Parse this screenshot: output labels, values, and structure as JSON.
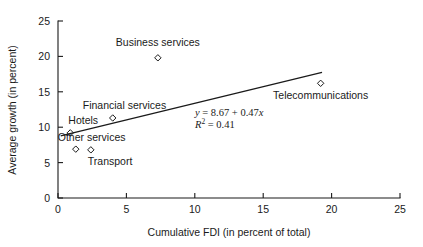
{
  "chart_data": {
    "type": "scatter",
    "title": "",
    "xlabel": "Cumulative FDI (in percent of total)",
    "ylabel": "Average growth (in percent)",
    "xlim": [
      0,
      25
    ],
    "ylim": [
      0,
      25
    ],
    "xticks": [
      "0",
      "5",
      "10",
      "15",
      "20",
      "25"
    ],
    "yticks": [
      "0",
      "5",
      "10",
      "15",
      "20",
      "25"
    ],
    "xtick_values": [
      0,
      5,
      10,
      15,
      20,
      25
    ],
    "ytick_values": [
      0,
      5,
      10,
      15,
      20,
      25
    ],
    "grid": false,
    "legend": "none",
    "marker_style": "open-diamond",
    "points": [
      {
        "label": "Hotels",
        "x": 0.9,
        "y": 9.2,
        "label_dx": -2,
        "label_dy": -9,
        "anchor": "start"
      },
      {
        "label": "Other services",
        "x": 1.3,
        "y": 6.9,
        "label_dx": -18,
        "label_dy": -8,
        "anchor": "start"
      },
      {
        "label": "Transport",
        "x": 2.4,
        "y": 6.8,
        "label_dx": -3,
        "label_dy": 15,
        "anchor": "start"
      },
      {
        "label": "Financial services",
        "x": 4.0,
        "y": 11.3,
        "label_dx": -30,
        "label_dy": -9,
        "anchor": "start"
      },
      {
        "label": "Business services",
        "x": 7.3,
        "y": 19.8,
        "label_dx": 0,
        "label_dy": -12,
        "anchor": "middle"
      },
      {
        "label": "Telecommunications",
        "x": 19.2,
        "y": 16.2,
        "label_dx": 0,
        "label_dy": 16,
        "anchor": "middle"
      }
    ],
    "regression": {
      "intercept": 8.67,
      "slope": 0.47,
      "r_squared": 0.41,
      "x_start": 0.2,
      "x_end": 19.3,
      "equation_text": "y = 8.67 + 0.47x",
      "r_squared_text": "R2 = 0.41",
      "eq_parts": {
        "y": "y",
        "eq1": " = 8.67 + 0.47",
        "x": "x",
        "r": "R",
        "sup": "2",
        "eq2": " = 0.41"
      }
    },
    "colors": {
      "axis": "#1a1a1a",
      "marker": "#1a1a1a",
      "trendline": "#1a1a1a",
      "text": "#1a1a1a",
      "background": "#ffffff"
    }
  }
}
